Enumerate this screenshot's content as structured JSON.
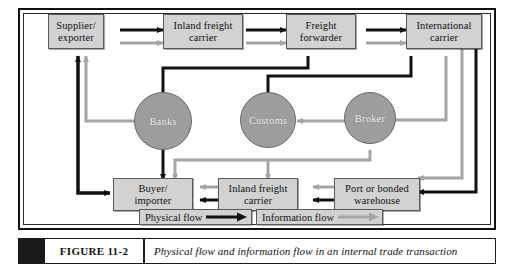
{
  "figure": {
    "number": "FIGURE 11-2",
    "caption": "Physical flow and information flow in an internal trade transaction"
  },
  "diagram": {
    "title": "Physical flow and information flow in an internal trade transaction",
    "type": "flow-diagram",
    "colors": {
      "box_fill": "#d2d2d2",
      "box_border": "#5a5a5a",
      "circle_fill": "#9d9d9d",
      "circle_text": "#f2f2f2",
      "physical_flow": "#111111",
      "information_flow": "#a5a5a5",
      "frame": "#111111",
      "page_background": "#ffffff"
    },
    "nodes": [
      {
        "id": "supplier",
        "shape": "box",
        "line1": "Supplier/",
        "line2": "exporter"
      },
      {
        "id": "inland_out",
        "shape": "box",
        "line1": "Inland freight",
        "line2": "carrier"
      },
      {
        "id": "forwarder",
        "shape": "box",
        "line1": "Freight",
        "line2": "forwarder"
      },
      {
        "id": "intl",
        "shape": "box",
        "line1": "International",
        "line2": "carrier"
      },
      {
        "id": "banks",
        "shape": "circle",
        "label": "Banks"
      },
      {
        "id": "customs",
        "shape": "circle",
        "label": "Customs"
      },
      {
        "id": "broker",
        "shape": "circle",
        "label": "Broker"
      },
      {
        "id": "buyer",
        "shape": "box",
        "line1": "Buyer/",
        "line2": "importer"
      },
      {
        "id": "inland_in",
        "shape": "box",
        "line1": "Inland freight",
        "line2": "carrier"
      },
      {
        "id": "port",
        "shape": "box",
        "line1": "Port or bonded",
        "line2": "warehouse"
      }
    ],
    "edges": [
      {
        "from": "supplier",
        "to": "inland_out",
        "flow": "physical"
      },
      {
        "from": "supplier",
        "to": "inland_out",
        "flow": "information"
      },
      {
        "from": "inland_out",
        "to": "forwarder",
        "flow": "physical"
      },
      {
        "from": "inland_out",
        "to": "forwarder",
        "flow": "information"
      },
      {
        "from": "forwarder",
        "to": "intl",
        "flow": "physical"
      },
      {
        "from": "forwarder",
        "to": "intl",
        "flow": "information"
      },
      {
        "from": "forwarder",
        "to": "banks",
        "flow": "physical"
      },
      {
        "from": "intl",
        "to": "customs",
        "flow": "physical"
      },
      {
        "from": "intl",
        "to": "broker",
        "flow": "information"
      },
      {
        "from": "intl",
        "to": "port",
        "flow": "information"
      },
      {
        "from": "intl",
        "to": "port",
        "flow": "physical"
      },
      {
        "from": "customs",
        "to": "broker",
        "flow": "information",
        "bidirectional": true
      },
      {
        "from": "banks",
        "to": "buyer",
        "flow": "physical",
        "bidirectional": true
      },
      {
        "from": "banks",
        "to": "supplier",
        "flow": "information"
      },
      {
        "from": "broker",
        "to": "inland_in",
        "flow": "information"
      },
      {
        "from": "broker",
        "to": "buyer",
        "flow": "information"
      },
      {
        "from": "port",
        "to": "inland_in",
        "flow": "physical"
      },
      {
        "from": "port",
        "to": "inland_in",
        "flow": "information"
      },
      {
        "from": "inland_in",
        "to": "buyer",
        "flow": "physical"
      },
      {
        "from": "inland_in",
        "to": "buyer",
        "flow": "information"
      },
      {
        "from": "buyer",
        "to": "supplier",
        "flow": "physical"
      }
    ],
    "legend": [
      {
        "id": "physical",
        "label": "Physical flow",
        "color": "#111111"
      },
      {
        "id": "information",
        "label": "Information flow",
        "color": "#a5a5a5"
      }
    ]
  }
}
